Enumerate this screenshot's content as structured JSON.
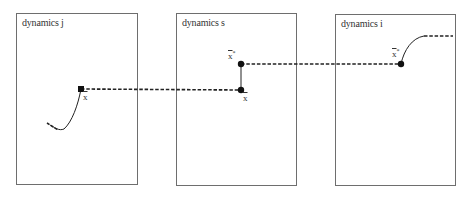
{
  "panels": [
    {
      "id": "j",
      "title": "dynamics j"
    },
    {
      "id": "s",
      "title": "dynamics s"
    },
    {
      "id": "i",
      "title": "dynamics i"
    }
  ],
  "labels": {
    "j_point": "x",
    "s_upper": "x",
    "s_upper_star": "*",
    "s_lower": "x",
    "i_point": "x",
    "i_point_star": "*"
  },
  "colors": {
    "line": "#222222",
    "border": "#6e6e6e",
    "dot": "#111111"
  }
}
